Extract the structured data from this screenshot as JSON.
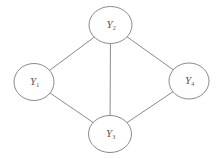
{
  "diagram": {
    "type": "undirected-graph",
    "nodes": [
      {
        "id": "Y1",
        "base": "Y",
        "sub": "1"
      },
      {
        "id": "Y2",
        "base": "Y",
        "sub": "2"
      },
      {
        "id": "Y3",
        "base": "Y",
        "sub": "3"
      },
      {
        "id": "Y4",
        "base": "Y",
        "sub": "4"
      }
    ],
    "edges": [
      {
        "from": "Y1",
        "to": "Y2"
      },
      {
        "from": "Y2",
        "to": "Y3"
      },
      {
        "from": "Y2",
        "to": "Y4"
      },
      {
        "from": "Y1",
        "to": "Y3"
      },
      {
        "from": "Y3",
        "to": "Y4"
      }
    ],
    "colors": {
      "stroke": "#8a8a8a",
      "label": "#555555",
      "background": "#ffffff"
    }
  }
}
